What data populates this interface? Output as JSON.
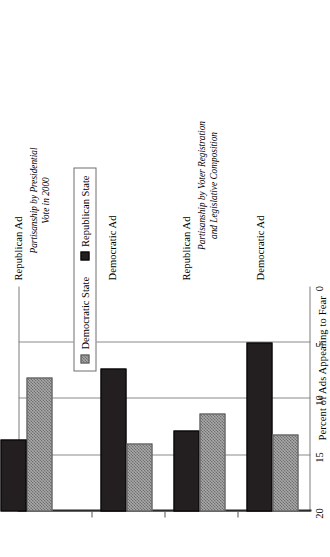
{
  "chart_data": {
    "type": "bar",
    "orientation": "horizontal",
    "title": "",
    "xlabel": "",
    "ylabel": "Percent of Ads Appealing to Fear",
    "ylim": [
      0,
      20
    ],
    "yticks": [
      0,
      5,
      10,
      15,
      20
    ],
    "ytick_labels": [
      "0",
      "5",
      "10",
      "15",
      "20"
    ],
    "grid": true,
    "legend_position": "bottom-right",
    "categories": [
      "Democratic Ad",
      "Republican Ad",
      "Democratic Ad",
      "Republican Ad"
    ],
    "groups": [
      {
        "label": "Partisanship by Voter Registration and Legislative Composition",
        "label_line1": "Partisanship by Voter Registration",
        "label_line2": "and Legislative Composition",
        "categories": [
          "Democratic Ad",
          "Republican Ad"
        ]
      },
      {
        "label": "Partisanship by Presidential Vote in 2000",
        "label_line1": "Partisanship by Presidential",
        "label_line2": "Vote in 2000",
        "categories": [
          "Democratic Ad",
          "Republican Ad"
        ]
      }
    ],
    "series": [
      {
        "name": "Republican State",
        "color": "#231f20",
        "pattern": "solid-black",
        "values": [
          15.0,
          7.2,
          12.7,
          6.4
        ]
      },
      {
        "name": "Democratic State",
        "color": "#a9a9a9",
        "pattern": "checkered-gray",
        "values": [
          6.8,
          8.7,
          6.0,
          11.9
        ]
      }
    ]
  },
  "axis": {
    "title": "Percent of Ads Appealing to Fear",
    "ticks": [
      "20",
      "15",
      "10",
      "5",
      "0"
    ]
  },
  "legend": {
    "items": [
      {
        "label": "Democratic State",
        "swatch": "checkered-gray-swatch"
      },
      {
        "label": "Republican State",
        "swatch": "solid-black-swatch"
      }
    ]
  },
  "categories": {
    "g1_cat1": "Democratic Ad",
    "g1_cat2": "Republican Ad",
    "g2_cat1": "Democratic Ad",
    "g2_cat2": "Republican Ad"
  },
  "group_titles": {
    "g1_line1": "Partisanship by Voter Registration",
    "g1_line2": "and Legislative Composition",
    "g2_line1": "Partisanship by Presidential",
    "g2_line2": "Vote in 2000"
  }
}
